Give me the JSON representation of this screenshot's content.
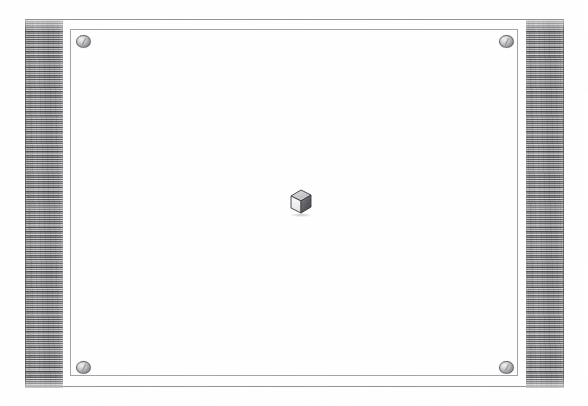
{
  "scene": {
    "title": "Framed white panel with central cube",
    "medium": "pencil-sketch",
    "width": 588,
    "height": 406,
    "background_color": "#ffffff"
  },
  "frame": {
    "outer_border_label": "outer frame rule",
    "inner_border_label": "inner frame rule",
    "border_color": "#4b4b50",
    "panel_color": "#ffffff"
  },
  "side_panels": {
    "left_label": "left hatched band",
    "right_label": "right hatched band",
    "fill_color": "#9a9a9c",
    "hatch_color": "#282a2c"
  },
  "fasteners": {
    "label": "corner screw",
    "count": 4,
    "color": "#9f9fa3",
    "positions": [
      "top-left",
      "top-right",
      "bottom-left",
      "bottom-right"
    ]
  },
  "center_object": {
    "label": "cube",
    "icon": "cube-icon",
    "top_face_color": "#d8d8da",
    "left_face_color": "#f6f6f6",
    "right_face_color": "#6e6e73",
    "outline_color": "#3a3a3e"
  }
}
